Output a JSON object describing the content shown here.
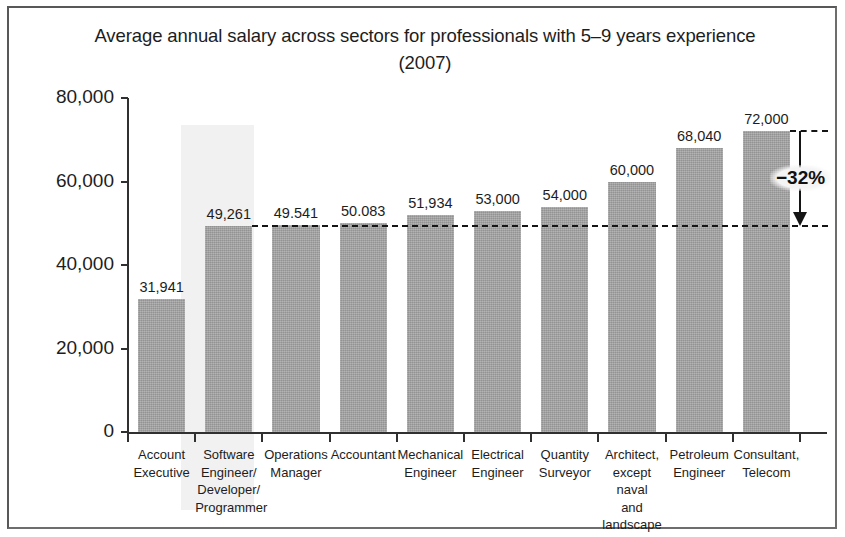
{
  "figure": {
    "title": "Average annual salary across sectors for professionals with 5–9 years experience (2007)",
    "title_line1": "Average annual salary across sectors for professionals with 5–9 years experience",
    "title_line2": "(2007)",
    "highlight_category_index": 1,
    "border_color": "#6d6d6d",
    "bar_color": "#a3a3a3",
    "highlight_color": "#f1f1f1",
    "annotation_color": "#151515"
  },
  "chart_data": {
    "type": "bar",
    "title": "Average annual salary across sectors for professionals with 5–9 years experience (2007)",
    "xlabel": "",
    "ylabel": "Wages (RM)",
    "ylim": [
      0,
      80000
    ],
    "yticks": [
      0,
      20000,
      40000,
      60000,
      80000
    ],
    "ytick_labels": [
      "0",
      "20,000",
      "40,000",
      "60,000",
      "80,000"
    ],
    "grid": false,
    "legend": false,
    "categories": [
      "Account Executive",
      "Software Engineer/ Developer/ Programmer",
      "Operations Manager",
      "Accountant",
      "Mechanical Engineer",
      "Electrical Engineer",
      "Quantity Surveyor",
      "Architect, except naval and landscape",
      "Petroleum Engineer",
      "Consultant, Telecom"
    ],
    "category_lines": [
      [
        "Account",
        "Executive"
      ],
      [
        "Software",
        "Engineer/",
        "Developer/",
        "Programmer"
      ],
      [
        "Operations",
        "Manager"
      ],
      [
        "Accountant"
      ],
      [
        "Mechanical",
        "Engineer"
      ],
      [
        "Electrical",
        "Engineer"
      ],
      [
        "Quantity",
        "Surveyor"
      ],
      [
        "Architect,",
        "except naval",
        "and",
        "landscape"
      ],
      [
        "Petroleum",
        "Engineer"
      ],
      [
        "Consultant,",
        "Telecom"
      ]
    ],
    "values": [
      31941,
      49261,
      49541,
      50083,
      51934,
      53000,
      54000,
      60000,
      68040,
      72000
    ],
    "value_labels": [
      "31,941",
      "49,261",
      "49.541",
      "50.083",
      "51,934",
      "53,000",
      "54,000",
      "60,000",
      "68,040",
      "72,000"
    ],
    "annotations": [
      {
        "text": "−32%",
        "type": "delta-bracket",
        "from_value": 72000,
        "to_value": 49261,
        "reference_lines": [
          72000,
          49261
        ]
      }
    ]
  }
}
